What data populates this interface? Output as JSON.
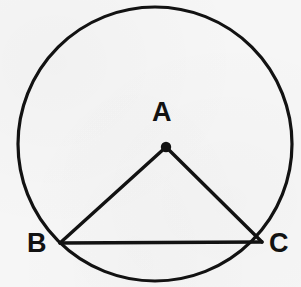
{
  "figure": {
    "background_color": "#f6f6f6",
    "stroke_color": "#121212",
    "width": 301,
    "height": 287
  },
  "labels": {
    "center": "A",
    "left_point": "B",
    "right_point": "C"
  },
  "geometry": {
    "circle": {
      "cx": 155,
      "cy": 144,
      "r": 137,
      "stroke_width": 3.2
    },
    "center_dot": {
      "cx": 166,
      "cy": 147,
      "r": 5.2
    },
    "points": {
      "A": {
        "x": 166,
        "y": 147
      },
      "B": {
        "x": 60,
        "y": 243
      },
      "C": {
        "x": 262,
        "y": 242
      }
    },
    "segments": [
      {
        "name": "AB",
        "x1": 166,
        "y1": 147,
        "x2": 60,
        "y2": 243,
        "stroke_width": 3.4
      },
      {
        "name": "AC",
        "x1": 166,
        "y1": 147,
        "x2": 262,
        "y2": 242,
        "stroke_width": 3.4
      },
      {
        "name": "BC",
        "x1": 60,
        "y1": 243,
        "x2": 262,
        "y2": 242,
        "stroke_width": 3.4
      }
    ]
  }
}
